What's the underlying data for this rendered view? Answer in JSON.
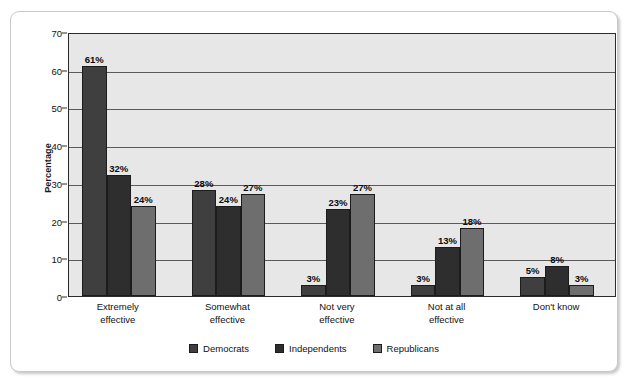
{
  "figure": {
    "background": "#ffffff",
    "frame_border_color": "#c8c8c8",
    "plot_background": "#e7e7e7",
    "axis_color": "#2b2b2b",
    "gridline_color": "#5a5a5a"
  },
  "chart_data": {
    "type": "bar",
    "title": "",
    "subtitle": "",
    "xlabel": "",
    "ylabel": "Percentage",
    "ylim": [
      0,
      70
    ],
    "yticks": [
      0,
      10,
      20,
      30,
      40,
      50,
      60,
      70
    ],
    "ytick_labels": [
      "0",
      "10",
      "20",
      "30",
      "40",
      "50",
      "60",
      "70"
    ],
    "grid": true,
    "grid_axis": "y",
    "legend_position": "bottom-center",
    "value_label_suffix": "%",
    "categories": [
      "Extremely effective",
      "Somewhat effective",
      "Not very effective",
      "Not at all effective",
      "Don't know"
    ],
    "category_label_lines": [
      [
        "Extremely",
        "effective"
      ],
      [
        "Somewhat",
        "effective"
      ],
      [
        "Not very",
        "effective"
      ],
      [
        "Not at all",
        "effective"
      ],
      [
        "Don't know"
      ]
    ],
    "series": [
      {
        "name": "Democrats",
        "color": "#3f3f3f",
        "values": [
          61,
          28,
          3,
          3,
          5
        ],
        "labels": [
          "61%",
          "28%",
          "3%",
          "3%",
          "5%"
        ]
      },
      {
        "name": "Independents",
        "color": "#2e2e2e",
        "values": [
          32,
          24,
          23,
          13,
          8
        ],
        "labels": [
          "32%",
          "24%",
          "23%",
          "13%",
          "8%"
        ]
      },
      {
        "name": "Republicans",
        "color": "#6e6e6e",
        "values": [
          24,
          27,
          27,
          18,
          3
        ],
        "labels": [
          "24%",
          "27%",
          "27%",
          "18%",
          "3%"
        ]
      }
    ]
  }
}
